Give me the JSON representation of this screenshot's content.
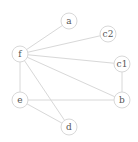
{
  "diagram": {
    "type": "undirected-graph",
    "nodes": [
      {
        "id": "a",
        "label": "a",
        "x": 69,
        "y": 21
      },
      {
        "id": "c2",
        "label": "c2",
        "x": 108,
        "y": 34
      },
      {
        "id": "f",
        "label": "f",
        "x": 20,
        "y": 54
      },
      {
        "id": "c1",
        "label": "c1",
        "x": 122,
        "y": 64
      },
      {
        "id": "e",
        "label": "e",
        "x": 20,
        "y": 100
      },
      {
        "id": "b",
        "label": "b",
        "x": 122,
        "y": 100
      },
      {
        "id": "d",
        "label": "d",
        "x": 69,
        "y": 127
      }
    ],
    "edges": [
      [
        "f",
        "a"
      ],
      [
        "f",
        "c2"
      ],
      [
        "f",
        "c1"
      ],
      [
        "f",
        "b"
      ],
      [
        "f",
        "e"
      ],
      [
        "f",
        "d"
      ],
      [
        "c1",
        "b"
      ],
      [
        "e",
        "b"
      ],
      [
        "e",
        "d"
      ]
    ],
    "node_radius": 8,
    "colors": {
      "stroke": "#d8d8d8",
      "label": "#555555",
      "background": "#ffffff"
    }
  }
}
